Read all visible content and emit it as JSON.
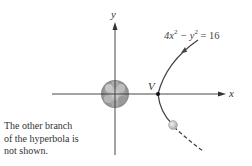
{
  "diagram": {
    "axis_labels": {
      "x": "x",
      "y": "y"
    },
    "vertex_label": "V",
    "equation": {
      "a": "4x",
      "exp1": "2",
      "minus": " − y",
      "exp2": "2",
      "rhs": " = 16"
    },
    "note_lines": [
      "The other branch",
      "of the hyperbola is",
      "not shown."
    ],
    "colors": {
      "axis": "#333333",
      "curve": "#444444",
      "planet": "#888888",
      "comet": "#cccccc"
    }
  }
}
